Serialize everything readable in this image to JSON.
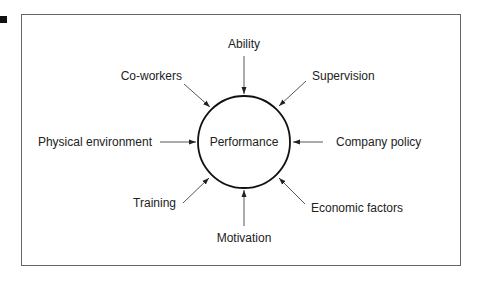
{
  "center": {
    "label": "Performance"
  },
  "factors": [
    {
      "id": "ability",
      "label": "Ability",
      "direction": "top"
    },
    {
      "id": "supervision",
      "label": "Supervision",
      "direction": "top-right"
    },
    {
      "id": "company-policy",
      "label": "Company policy",
      "direction": "right"
    },
    {
      "id": "economic-factors",
      "label": "Economic factors",
      "direction": "bottom-right"
    },
    {
      "id": "motivation",
      "label": "Motivation",
      "direction": "bottom"
    },
    {
      "id": "training",
      "label": "Training",
      "direction": "bottom-left"
    },
    {
      "id": "physical-environment",
      "label": "Physical environment",
      "direction": "left"
    },
    {
      "id": "co-workers",
      "label": "Co-workers",
      "direction": "top-left"
    }
  ]
}
